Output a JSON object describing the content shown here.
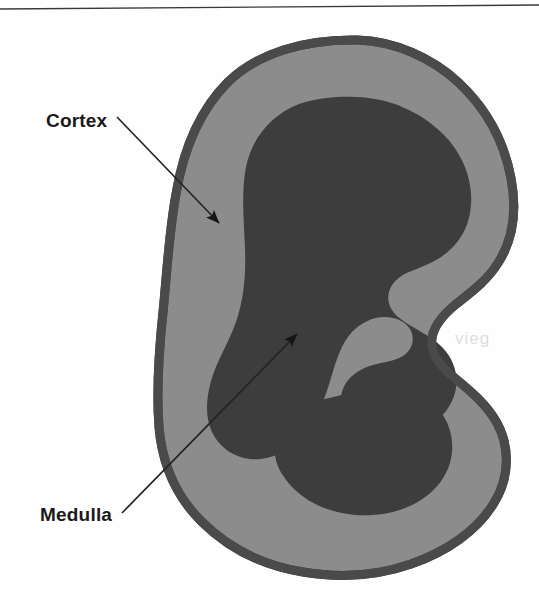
{
  "figure": {
    "kind": "anatomical-diagram",
    "labels": [
      {
        "id": "cortex",
        "text": "Cortex",
        "x": 46,
        "y": 127,
        "leader_from": [
          117,
          117
        ],
        "leader_to": [
          219,
          223
        ]
      },
      {
        "id": "medulla",
        "text": "Medulla",
        "x": 40,
        "y": 521,
        "leader_from": [
          122,
          513
        ],
        "leader_to": [
          297,
          334
        ]
      }
    ],
    "regions": [
      {
        "id": "cortex-region",
        "name": "Cortex",
        "color": "#8c8c8c"
      },
      {
        "id": "medulla-region",
        "name": "Medulla",
        "color": "#3d3d3d"
      },
      {
        "id": "capsule-outline",
        "name": "Capsule outline",
        "color": "#4a4a4a"
      }
    ],
    "rule": {
      "name": "header-rule",
      "color": "#3a3a3a"
    },
    "bleed_through_text": "vieg"
  },
  "colors": {
    "background": "#fefefe",
    "cortex": "#8c8c8c",
    "medulla": "#3d3d3d",
    "outline": "#4a4a4a",
    "label": "#1a1a1a",
    "leader": "#242424",
    "rule": "#3a3a3a",
    "bleed": "#d9d9d9"
  }
}
